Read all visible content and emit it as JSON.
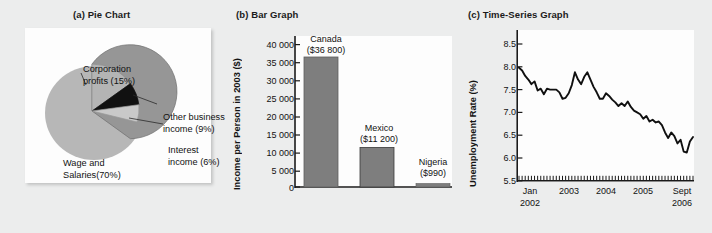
{
  "figure": {
    "background": "#eceded",
    "panels": [
      {
        "title": "(a) Pie Chart"
      },
      {
        "title": "(b) Bar Graph"
      },
      {
        "title": "(c) Time-Series Graph"
      }
    ]
  },
  "colors": {
    "slice_wage": "#969696",
    "slice_corporation": "#b4b4b4",
    "slice_other": "#111111",
    "slice_interest": "#c9c9c9",
    "bar_fill": "#7e7e7e",
    "line": "#101010",
    "panel_bg": "#fdfdfd",
    "text": "#121212"
  },
  "pie": {
    "title": "(a) Pie Chart",
    "labels": {
      "corporation": "Corporation\nprofits (15%)",
      "corporation_line1": "Corporation",
      "corporation_line2": "profits (15%)",
      "other_line1": "Other business",
      "other_line2": "income (9%)",
      "interest_line1": "Interest",
      "interest_line2": "income (6%)",
      "wage_line1": "Wage and",
      "wage_line2": "Salaries(70%)"
    }
  },
  "bar": {
    "title": "(b) Bar Graph",
    "ylabel": "Income per Person in 2003 ($)",
    "bars": [
      {
        "name": "Canada",
        "value_label": "($36 800)",
        "value": 36800
      },
      {
        "name": "Mexico",
        "value_label": "($11 200)",
        "value": 11200
      },
      {
        "name": "Nigeria",
        "value_label": "($990)",
        "value": 990
      }
    ]
  },
  "timeseries": {
    "title": "(c) Time-Series Graph",
    "ylabel": "Unemployment Rate (%)",
    "xlabels": [
      {
        "line1": "Jan",
        "line2": "2002"
      },
      {
        "line1": "2003",
        "line2": ""
      },
      {
        "line1": "2004",
        "line2": ""
      },
      {
        "line1": "2005",
        "line2": ""
      },
      {
        "line1": "Sept",
        "line2": "2006"
      }
    ]
  },
  "chart_data": [
    {
      "type": "pie",
      "title": "(a) Pie Chart",
      "categories": [
        "Wage and Salaries",
        "Corporation profits",
        "Other business income",
        "Interest income"
      ],
      "values": [
        70,
        15,
        9,
        6
      ],
      "labels": [
        "Wage and Salaries(70%)",
        "Corporation profits (15%)",
        "Other business income (9%)",
        "Interest income (6%)"
      ],
      "unit": "percent",
      "colors": [
        "#969696",
        "#b4b4b4",
        "#111111",
        "#c9c9c9"
      ],
      "legend": "labels-with-leader-lines"
    },
    {
      "type": "bar",
      "title": "(b) Bar Graph",
      "categories": [
        "Canada",
        "Mexico",
        "Nigeria"
      ],
      "values": [
        36800,
        11200,
        990
      ],
      "value_labels": [
        "($36 800)",
        "($11 200)",
        "($990)"
      ],
      "xlabel": "",
      "ylabel": "Income per Person in 2003 ($)",
      "ylim": [
        0,
        42000
      ],
      "yticks": [
        0,
        5000,
        10000,
        15000,
        20000,
        25000,
        30000,
        35000,
        40000
      ],
      "ytick_labels": [
        "0",
        "5 000",
        "10 000",
        "15 000",
        "20 000",
        "25 000",
        "30 000",
        "35 000",
        "40 000"
      ],
      "grid": false
    },
    {
      "type": "line",
      "title": "(c) Time-Series Graph",
      "xlabel": "",
      "ylabel": "Unemployment Rate (%)",
      "ylim": [
        5.5,
        8.75
      ],
      "yticks": [
        5.5,
        6.0,
        6.5,
        7.0,
        7.5,
        8.0,
        8.5
      ],
      "ytick_labels": [
        "5.5",
        "6.0",
        "6.5",
        "7.0",
        "7.5",
        "8.0",
        "8.5"
      ],
      "xtick_labels": [
        "Jan 2002",
        "2003",
        "2004",
        "2005",
        "Sept 2006"
      ],
      "x_start": "Jan 2002",
      "x_end": "Sept 2006",
      "x_interval": "monthly",
      "grid": false,
      "x": [
        "2002-01",
        "2002-02",
        "2002-03",
        "2002-04",
        "2002-05",
        "2002-06",
        "2002-07",
        "2002-08",
        "2002-09",
        "2002-10",
        "2002-11",
        "2002-12",
        "2003-01",
        "2003-02",
        "2003-03",
        "2003-04",
        "2003-05",
        "2003-06",
        "2003-07",
        "2003-08",
        "2003-09",
        "2003-10",
        "2003-11",
        "2003-12",
        "2004-01",
        "2004-02",
        "2004-03",
        "2004-04",
        "2004-05",
        "2004-06",
        "2004-07",
        "2004-08",
        "2004-09",
        "2004-10",
        "2004-11",
        "2004-12",
        "2005-01",
        "2005-02",
        "2005-03",
        "2005-04",
        "2005-05",
        "2005-06",
        "2005-07",
        "2005-08",
        "2005-09",
        "2005-10",
        "2005-11",
        "2005-12",
        "2006-01",
        "2006-02",
        "2006-03",
        "2006-04",
        "2006-05",
        "2006-06",
        "2006-07",
        "2006-08",
        "2006-09"
      ],
      "values": [
        7.98,
        7.92,
        7.8,
        7.72,
        7.62,
        7.68,
        7.48,
        7.52,
        7.4,
        7.52,
        7.5,
        7.5,
        7.5,
        7.44,
        7.3,
        7.32,
        7.42,
        7.6,
        7.88,
        7.72,
        7.62,
        7.78,
        7.88,
        7.72,
        7.56,
        7.44,
        7.3,
        7.3,
        7.42,
        7.36,
        7.28,
        7.22,
        7.14,
        7.2,
        7.14,
        7.24,
        7.12,
        7.04,
        7.0,
        6.96,
        6.86,
        6.92,
        6.8,
        6.84,
        6.78,
        6.8,
        6.72,
        6.56,
        6.44,
        6.56,
        6.48,
        6.32,
        6.4,
        6.14,
        6.12,
        6.36,
        6.46
      ]
    }
  ]
}
